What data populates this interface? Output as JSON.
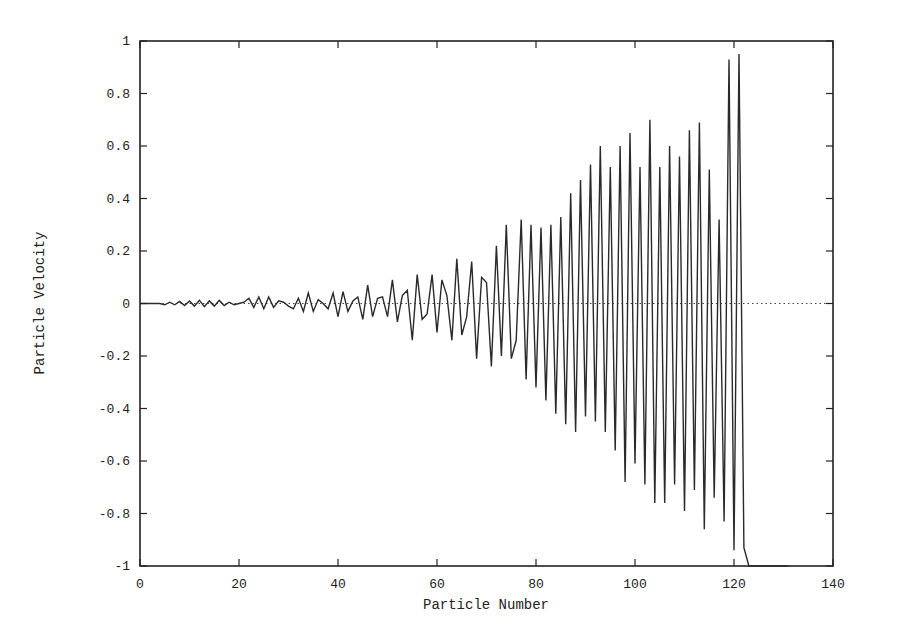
{
  "chart_data": {
    "type": "line",
    "title": "",
    "xlabel": "Particle Number",
    "ylabel": "Particle Velocity",
    "xlim": [
      0,
      140
    ],
    "ylim": [
      -1,
      1
    ],
    "xticks": [
      0,
      20,
      40,
      60,
      80,
      100,
      120,
      140
    ],
    "yticks": [
      -1,
      -0.8,
      -0.6,
      -0.4,
      -0.2,
      0,
      0.2,
      0.4,
      0.6,
      0.8,
      1
    ],
    "xtick_labels": [
      "0",
      "20",
      "40",
      "60",
      "80",
      "100",
      "120",
      "140"
    ],
    "ytick_labels": [
      "-1",
      "-0.8",
      "-0.6",
      "-0.4",
      "-0.2",
      "0",
      "0.2",
      "0.4",
      "0.6",
      "0.8",
      "1"
    ],
    "grid": false,
    "legend": null,
    "reference_line": {
      "y": 0,
      "style": "dotted"
    },
    "series": [
      {
        "name": "velocity",
        "x": [
          0,
          1,
          2,
          3,
          4,
          5,
          6,
          7,
          8,
          9,
          10,
          11,
          12,
          13,
          14,
          15,
          16,
          17,
          18,
          19,
          20,
          21,
          22,
          23,
          24,
          25,
          26,
          27,
          28,
          29,
          30,
          31,
          32,
          33,
          34,
          35,
          36,
          37,
          38,
          39,
          40,
          41,
          42,
          43,
          44,
          45,
          46,
          47,
          48,
          49,
          50,
          51,
          52,
          53,
          54,
          55,
          56,
          57,
          58,
          59,
          60,
          61,
          62,
          63,
          64,
          65,
          66,
          67,
          68,
          69,
          70,
          71,
          72,
          73,
          74,
          75,
          76,
          77,
          78,
          79,
          80,
          81,
          82,
          83,
          84,
          85,
          86,
          87,
          88,
          89,
          90,
          91,
          92,
          93,
          94,
          95,
          96,
          97,
          98,
          99,
          100,
          101,
          102,
          103,
          104,
          105,
          106,
          107,
          108,
          109,
          110,
          111,
          112,
          113,
          114,
          115,
          116,
          117,
          118,
          119,
          120,
          121,
          122,
          123,
          124,
          125,
          126,
          127,
          128,
          129,
          130,
          131
        ],
        "values": [
          0,
          0,
          0,
          0,
          0,
          -0.005,
          0.005,
          -0.005,
          0.008,
          -0.008,
          0.01,
          -0.01,
          0.012,
          -0.012,
          0.01,
          -0.01,
          0.012,
          -0.008,
          0.005,
          -0.005,
          0,
          0.005,
          0.02,
          -0.015,
          0.025,
          -0.02,
          0.025,
          -0.015,
          0.01,
          0.005,
          -0.01,
          -0.02,
          0.02,
          -0.03,
          0.04,
          -0.03,
          0.015,
          0,
          -0.02,
          0.04,
          -0.05,
          0.045,
          -0.03,
          0.01,
          0.025,
          -0.06,
          0.07,
          -0.05,
          0.02,
          0.025,
          -0.05,
          0.09,
          -0.07,
          0.03,
          0.05,
          -0.14,
          0.11,
          -0.06,
          -0.04,
          0.11,
          -0.11,
          0.09,
          0.03,
          -0.14,
          0.17,
          -0.12,
          -0.05,
          0.16,
          -0.21,
          0.1,
          0.08,
          -0.24,
          0.22,
          -0.2,
          0.3,
          -0.21,
          -0.14,
          0.32,
          -0.29,
          0.3,
          -0.32,
          0.29,
          -0.37,
          0.3,
          -0.42,
          0.33,
          -0.46,
          0.42,
          -0.49,
          0.47,
          -0.43,
          0.53,
          -0.45,
          0.6,
          -0.49,
          0.52,
          -0.56,
          0.6,
          -0.68,
          0.65,
          -0.61,
          0.52,
          -0.69,
          0.7,
          -0.76,
          0.52,
          -0.76,
          0.6,
          -0.69,
          0.56,
          -0.79,
          0.66,
          -0.71,
          0.69,
          -0.86,
          0.51,
          -0.74,
          0.32,
          -0.83,
          0.93,
          -0.94,
          0.95,
          -0.93,
          -1,
          -1,
          -1,
          -1,
          -1,
          -1,
          -1,
          -1,
          -1
        ]
      }
    ]
  }
}
